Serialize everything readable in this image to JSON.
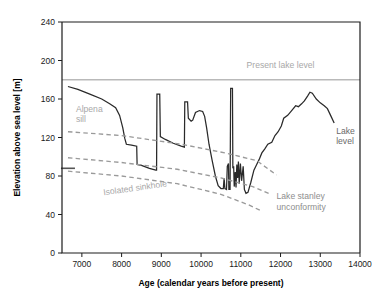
{
  "chart_data": {
    "type": "line",
    "title": "",
    "xlabel": "Age (calendar years before present)",
    "ylabel": "Elevation above sea level [m]",
    "xlim": [
      6500,
      14000
    ],
    "ylim": [
      0,
      240
    ],
    "xticks": [
      7000,
      8000,
      9000,
      10000,
      11000,
      12000,
      13000,
      14000
    ],
    "xticklabels": [
      "7000",
      "8000",
      "9000",
      "10000",
      "11000",
      "12000",
      "13000",
      "14000"
    ],
    "yticks": [
      0,
      40,
      80,
      120,
      160,
      200,
      240
    ],
    "yticklabels": [
      "0",
      "40",
      "80",
      "120",
      "160",
      "200",
      "240"
    ],
    "grid": false,
    "legend": "none",
    "axis_direction": "x increases left to right (years before present)",
    "series": [
      {
        "name": "Lake level",
        "style": "solid",
        "color": "#2a2a2a",
        "points": [
          [
            6650,
            173
          ],
          [
            6900,
            170
          ],
          [
            7200,
            165
          ],
          [
            7500,
            160
          ],
          [
            7700,
            155
          ],
          [
            7850,
            151
          ],
          [
            7950,
            143
          ],
          [
            8030,
            130
          ],
          [
            8080,
            119
          ],
          [
            8120,
            113
          ],
          [
            8250,
            112
          ],
          [
            8380,
            111
          ],
          [
            8390,
            92
          ],
          [
            8500,
            91
          ],
          [
            8700,
            88
          ],
          [
            8860,
            86
          ],
          [
            8880,
            86
          ],
          [
            8890,
            165
          ],
          [
            8960,
            165
          ],
          [
            8975,
            121
          ],
          [
            9100,
            118
          ],
          [
            9300,
            114
          ],
          [
            9500,
            111
          ],
          [
            9580,
            110
          ],
          [
            9590,
            157
          ],
          [
            9660,
            157
          ],
          [
            9680,
            140
          ],
          [
            9750,
            137
          ],
          [
            9790,
            138
          ],
          [
            9860,
            146
          ],
          [
            9960,
            148
          ],
          [
            10040,
            147
          ],
          [
            10090,
            142
          ],
          [
            10140,
            130
          ],
          [
            10200,
            113
          ],
          [
            10280,
            96
          ],
          [
            10360,
            80
          ],
          [
            10430,
            70
          ],
          [
            10500,
            67
          ],
          [
            10560,
            67
          ],
          [
            10580,
            78
          ],
          [
            10600,
            67
          ],
          [
            10640,
            66
          ],
          [
            10660,
            90
          ],
          [
            10690,
            93
          ],
          [
            10700,
            66
          ],
          [
            10730,
            66
          ],
          [
            10745,
            171
          ],
          [
            10790,
            171
          ],
          [
            10800,
            88
          ],
          [
            10820,
            90
          ],
          [
            10835,
            69
          ],
          [
            10860,
            84
          ],
          [
            10880,
            68
          ],
          [
            10900,
            92
          ],
          [
            10920,
            78
          ],
          [
            10940,
            95
          ],
          [
            10960,
            72
          ],
          [
            10990,
            93
          ],
          [
            11020,
            75
          ],
          [
            11060,
            90
          ],
          [
            11090,
            66
          ],
          [
            11130,
            62
          ],
          [
            11180,
            63
          ],
          [
            11250,
            73
          ],
          [
            11330,
            86
          ],
          [
            11400,
            92
          ],
          [
            11460,
            97
          ],
          [
            11530,
            104
          ],
          [
            11600,
            108
          ],
          [
            11680,
            113
          ],
          [
            11780,
            115
          ],
          [
            11860,
            122
          ],
          [
            11940,
            126
          ],
          [
            12020,
            132
          ],
          [
            12080,
            140
          ],
          [
            12180,
            143
          ],
          [
            12280,
            148
          ],
          [
            12380,
            153
          ],
          [
            12450,
            152
          ],
          [
            12530,
            155
          ],
          [
            12600,
            158
          ],
          [
            12680,
            163
          ],
          [
            12740,
            167
          ],
          [
            12800,
            166
          ],
          [
            12900,
            160
          ],
          [
            13000,
            156
          ],
          [
            13100,
            153
          ],
          [
            13180,
            150
          ],
          [
            13260,
            143
          ],
          [
            13350,
            135
          ]
        ]
      },
      {
        "name": "Present lake level",
        "style": "solid-gray-horizontal",
        "color": "#b9b9b9",
        "value": 180,
        "points": [
          [
            6500,
            180
          ],
          [
            14000,
            180
          ]
        ]
      },
      {
        "name": "Alpena sill",
        "style": "dashed",
        "color": "#9a9a9a",
        "points": [
          [
            6650,
            126
          ],
          [
            8000,
            122
          ],
          [
            9500,
            113
          ],
          [
            10600,
            104
          ],
          [
            11400,
            96
          ],
          [
            11900,
            81
          ]
        ]
      },
      {
        "name": "Lake stanley unconformity upper",
        "style": "dashed",
        "color": "#9a9a9a",
        "points": [
          [
            6650,
            99
          ],
          [
            8000,
            94
          ],
          [
            9400,
            87
          ],
          [
            10500,
            78
          ],
          [
            11300,
            69
          ],
          [
            11750,
            61
          ]
        ]
      },
      {
        "name": "Isolated sinkhole",
        "style": "dashed",
        "color": "#9a9a9a",
        "points": [
          [
            6650,
            85
          ],
          [
            8000,
            80
          ],
          [
            9400,
            72
          ],
          [
            10500,
            61
          ],
          [
            11200,
            50
          ],
          [
            11500,
            44
          ]
        ]
      }
    ],
    "markers": [
      {
        "name": "left-axis-tick-mark",
        "x": 6650,
        "y": 88,
        "width_years": 200
      }
    ],
    "annotations": [
      {
        "name": "present-lake-level",
        "text": "Present lake level",
        "x": 12000,
        "y": 192,
        "color": "#a8a8a8",
        "anchor": "middle",
        "rotate": 0,
        "lines": [
          "Present lake level"
        ]
      },
      {
        "name": "alpena-sill",
        "text": "Alpena sill",
        "x": 6850,
        "y": 147,
        "color": "#a8a8a8",
        "anchor": "start",
        "rotate": 0,
        "lines": [
          "Alpena",
          "sill"
        ]
      },
      {
        "name": "isolated-sinkhole",
        "text": "Isolated sinkhole",
        "x": 7550,
        "y": 60,
        "color": "#a8a8a8",
        "anchor": "start",
        "rotate": -8,
        "lines": [
          "Isolated sinkhole"
        ]
      },
      {
        "name": "lake-stanley-unconformity",
        "text": "Lake stanley unconformity",
        "x": 11900,
        "y": 56,
        "color": "#8e8e8e",
        "anchor": "start",
        "rotate": 0,
        "lines": [
          "Lake stanley",
          "unconformity"
        ]
      },
      {
        "name": "lake-level",
        "text": "Lake level",
        "x": 13400,
        "y": 124,
        "color": "#6a6a6a",
        "anchor": "start",
        "rotate": 0,
        "lines": [
          "Lake",
          "level"
        ]
      }
    ]
  }
}
